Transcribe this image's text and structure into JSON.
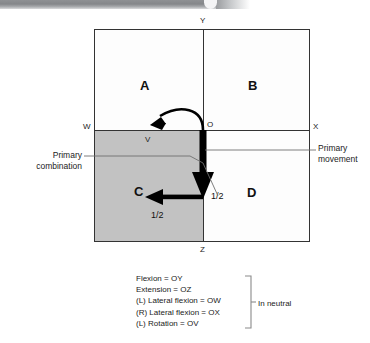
{
  "diagram": {
    "title_banner": "",
    "axis_labels": {
      "y": "Y",
      "z": "Z",
      "w": "W",
      "x": "X",
      "o": "O",
      "v": "V"
    },
    "quadrants": [
      {
        "key": "A",
        "label": "A"
      },
      {
        "key": "B",
        "label": "B"
      },
      {
        "key": "C",
        "label": "C"
      },
      {
        "key": "D",
        "label": "D"
      }
    ],
    "fractions": {
      "down_arrow": "1/2",
      "left_arrow": "1/2"
    },
    "callouts": {
      "left_line1": "Primary",
      "left_line2": "combination",
      "right_line1": "Primary",
      "right_line2": "movement"
    },
    "colors": {
      "shaded_quadrant": "#c2c2c2",
      "outline": "#333333",
      "arrow": "#000000",
      "banner": "#8f9194"
    }
  },
  "legend": {
    "lines": [
      "Flexion = OY",
      "Extension = OZ",
      "(L) Lateral flexion = OW",
      "(R) Lateral flexion = OX",
      "(L) Rotation = OV"
    ],
    "note": "In neutral"
  }
}
